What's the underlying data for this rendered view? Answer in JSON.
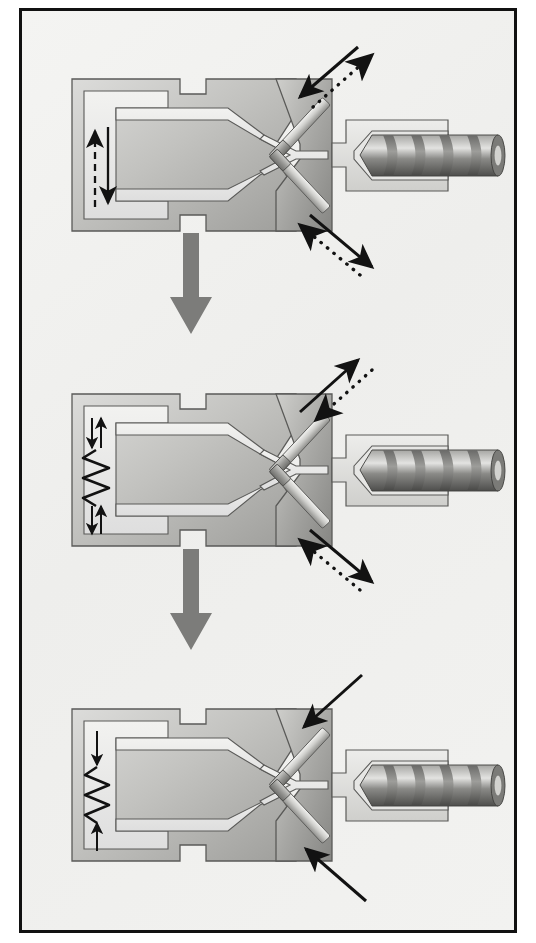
{
  "figure": {
    "type": "technical-diagram",
    "frame": {
      "border_color": "#111111",
      "background_color": "#f1f1ef"
    },
    "panel_count": 3
  },
  "colors": {
    "metal_light": "#d9d9d7",
    "metal_mid": "#b9b9b6",
    "metal_dark": "#8e8e8b",
    "metal_darker": "#6e6e6b",
    "cavity_fill": "#ececeb",
    "outline": "#5a5a58",
    "ink": "#121212",
    "transition_arrow": "#7c7c7a",
    "screw_dark": "#555553",
    "screw_light": "#c9c9c6"
  },
  "panels": [
    {
      "id": "stage-1",
      "name": "stage-one-injection",
      "label": "Stage 1",
      "indicator": {
        "name": "flow-indicator-arrows",
        "description": "dashed arrow pointing up beside solid arrow pointing down",
        "arrows": [
          {
            "style": "dashed",
            "direction": "up"
          },
          {
            "style": "solid",
            "direction": "down"
          }
        ]
      },
      "ejector_pins": [
        {
          "name": "upper-ejector-pin",
          "position": "upper",
          "arrows": [
            {
              "style": "solid",
              "direction": "down-left",
              "meaning": "in"
            },
            {
              "style": "dotted",
              "direction": "up-right",
              "meaning": "out"
            }
          ]
        },
        {
          "name": "lower-ejector-pin",
          "position": "lower",
          "arrows": [
            {
              "style": "solid",
              "direction": "down-right",
              "meaning": "out"
            },
            {
              "style": "dotted",
              "direction": "up-left",
              "meaning": "in"
            }
          ]
        }
      ],
      "screw": {
        "name": "extrusion-screw",
        "flights": 4,
        "retracted": false
      }
    },
    {
      "id": "stage-2",
      "name": "stage-two-vibration",
      "label": "Stage 2",
      "indicator": {
        "name": "vibration-indicator",
        "description": "zigzag spring with paired small arrows above and below",
        "arrows": [
          {
            "style": "solid",
            "direction": "down"
          },
          {
            "style": "solid",
            "direction": "up"
          }
        ],
        "zigzag": true
      },
      "ejector_pins": [
        {
          "name": "upper-ejector-pin",
          "position": "upper",
          "arrows": [
            {
              "style": "solid",
              "direction": "up-right",
              "meaning": "out"
            },
            {
              "style": "dotted",
              "direction": "down-left",
              "meaning": "in"
            }
          ]
        },
        {
          "name": "lower-ejector-pin",
          "position": "lower",
          "arrows": [
            {
              "style": "solid",
              "direction": "down-right",
              "meaning": "out"
            },
            {
              "style": "dotted",
              "direction": "up-left",
              "meaning": "in"
            }
          ]
        }
      ],
      "screw": {
        "name": "extrusion-screw",
        "flights": 4,
        "retracted": false
      }
    },
    {
      "id": "stage-3",
      "name": "stage-three-packing",
      "label": "Stage 3",
      "indicator": {
        "name": "compression-indicator",
        "description": "single zigzag spring with small arrows pointing toward each other",
        "arrows": [
          {
            "style": "solid",
            "direction": "down"
          },
          {
            "style": "solid",
            "direction": "up"
          }
        ],
        "zigzag": true
      },
      "ejector_pins": [
        {
          "name": "upper-ejector-pin",
          "position": "upper",
          "arrows": [
            {
              "style": "solid",
              "direction": "down-left",
              "meaning": "in"
            }
          ]
        },
        {
          "name": "lower-ejector-pin",
          "position": "lower",
          "arrows": [
            {
              "style": "solid",
              "direction": "up-left",
              "meaning": "in"
            }
          ]
        }
      ],
      "screw": {
        "name": "extrusion-screw",
        "flights": 4,
        "retracted": false
      }
    }
  ],
  "transitions": [
    {
      "name": "transition-arrow-1-to-2",
      "direction": "down",
      "from": "stage-1",
      "to": "stage-2"
    },
    {
      "name": "transition-arrow-2-to-3",
      "direction": "down",
      "from": "stage-2",
      "to": "stage-3"
    }
  ]
}
